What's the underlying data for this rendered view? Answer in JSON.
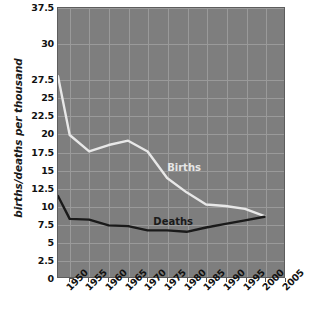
{
  "chart_data": {
    "type": "line",
    "title": "",
    "xlabel": "",
    "ylabel": "births/deaths per thousand",
    "x": [
      1950,
      1955,
      1960,
      1965,
      1970,
      1975,
      1980,
      1985,
      1990,
      1995,
      2000,
      2005
    ],
    "xtick_labels": [
      "1950",
      "1955",
      "1960",
      "1965",
      "1970",
      "1975",
      "1980",
      "1985",
      "1990",
      "1995",
      "2000",
      "2005"
    ],
    "ytick_labels": [
      "37.5",
      "30",
      "27.5",
      "25",
      "22.5",
      "20",
      "17.5",
      "15",
      "12.5",
      "10",
      "7.5",
      "5",
      "2.5",
      "0"
    ],
    "ytick_values": [
      37.5,
      32.5,
      27.5,
      25,
      22.5,
      20,
      17.5,
      15,
      12.5,
      10,
      7.5,
      5,
      2.5,
      0
    ],
    "ylim": [
      0,
      37.5
    ],
    "grid": true,
    "legend": "inline-labels",
    "series": [
      {
        "name": "Births",
        "color": "#e8e8e8",
        "label_text": "Births",
        "x": [
          1947,
          1950,
          1955,
          1960,
          1965,
          1970,
          1975,
          1980,
          1985,
          1990,
          1995,
          2000
        ],
        "values": [
          28.0,
          19.8,
          17.5,
          18.4,
          19.0,
          17.5,
          13.8,
          11.8,
          10.1,
          9.9,
          9.5,
          8.5
        ]
      },
      {
        "name": "Deaths",
        "color": "#1a1a1a",
        "label_text": "Deaths",
        "x": [
          1947,
          1950,
          1955,
          1960,
          1965,
          1970,
          1975,
          1980,
          1985,
          1990,
          1995,
          2000
        ],
        "values": [
          11.3,
          8.1,
          8.0,
          7.2,
          7.1,
          6.5,
          6.5,
          6.3,
          6.9,
          7.4,
          7.9,
          8.4
        ]
      }
    ]
  }
}
